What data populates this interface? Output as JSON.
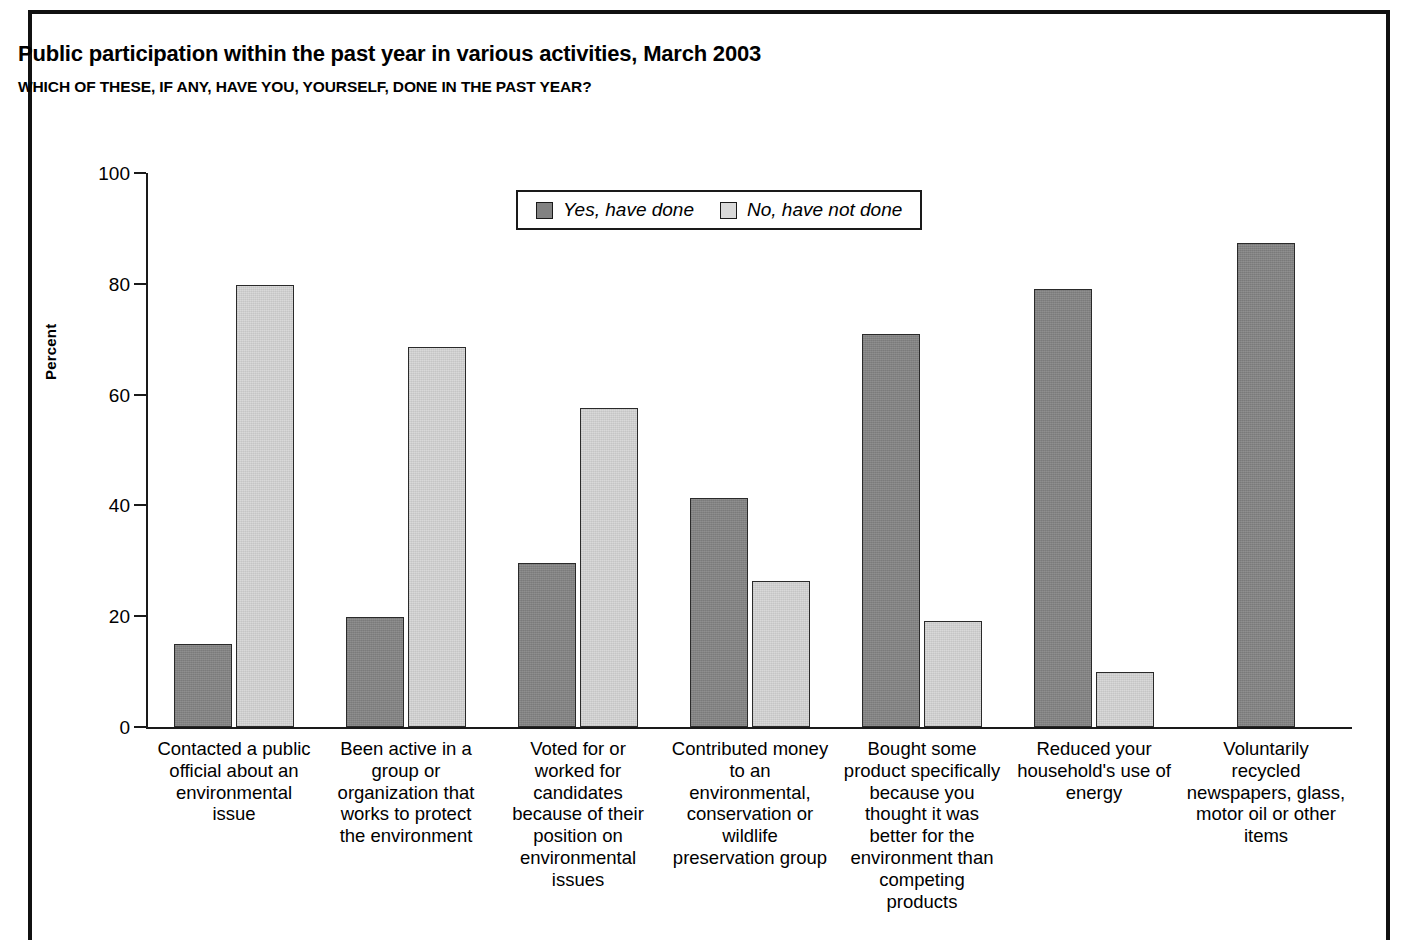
{
  "title": "Public participation within the past year in various activities, March 2003",
  "subtitle": "WHICH OF THESE, IF ANY, HAVE YOU, YOURSELF, DONE IN THE PAST YEAR?",
  "legend": {
    "yes_label": "Yes, have done",
    "no_label": "No, have not done",
    "yes_color": "#828282",
    "no_color": "#d9d9d9"
  },
  "axis": {
    "y_title": "Percent",
    "y_ticks": [
      "0",
      "20",
      "40",
      "60",
      "80",
      "100"
    ]
  },
  "chart_data": {
    "type": "bar",
    "title": "Public participation within the past year in various activities, March 2003",
    "subtitle": "WHICH OF THESE, IF ANY, HAVE YOU, YOURSELF, DONE IN THE PAST YEAR?",
    "xlabel": "",
    "ylabel": "Percent",
    "ylim": [
      0,
      100
    ],
    "yticks": [
      0,
      20,
      40,
      60,
      80,
      100
    ],
    "grid": false,
    "legend_position": "top-center",
    "categories": [
      "Contacted a public official about an environmental issue",
      "Been active in a group or organization that works to protect the environment",
      "Voted for or worked for candidates because of their position on environmental issues",
      "Contributed money to an environmental, conservation or wildlife preservation group",
      "Bought some product specifically because you thought it was better for the environment than competing products",
      "Reduced your household's use of energy",
      "Voluntarily recycled newspapers, glass, motor oil or other items"
    ],
    "series": [
      {
        "name": "Yes, have done",
        "values": [
          15,
          19.8,
          29.6,
          41.4,
          71,
          79,
          87.4
        ]
      },
      {
        "name": "No, have not done",
        "values": [
          79.8,
          68.6,
          57.5,
          26.3,
          19.2,
          10,
          null
        ]
      }
    ]
  },
  "categories_display": [
    [
      "Contacted a public",
      "official about an",
      "environmental",
      "issue"
    ],
    [
      "Been active in a",
      "group or",
      "organization that",
      "works to protect",
      "the environment"
    ],
    [
      "Voted for or",
      "worked for",
      "candidates",
      "because of their",
      "position on",
      "environmental",
      "issues"
    ],
    [
      "Contributed money",
      "to an",
      "environmental,",
      "conservation or",
      "wildlife",
      "preservation group"
    ],
    [
      "Bought some",
      "product specifically",
      "because you",
      "thought it was",
      "better for the",
      "environment than",
      "competing",
      "products"
    ],
    [
      "Reduced your",
      "household's use of",
      "energy"
    ],
    [
      "Voluntarily",
      "recycled",
      "newspapers, glass,",
      "motor oil or other",
      "items"
    ]
  ]
}
